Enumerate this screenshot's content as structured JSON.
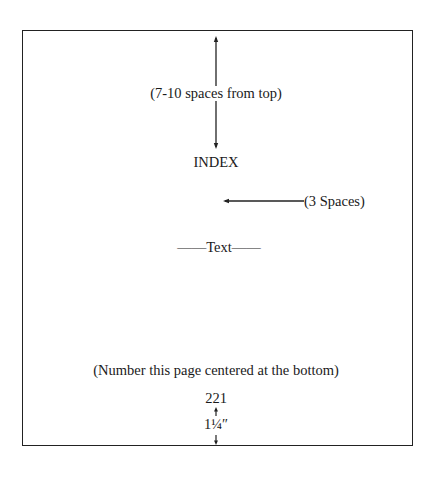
{
  "diagram": {
    "top_spacing_label": "(7-10 spaces from top)",
    "heading": "INDEX",
    "side_spacing_label": "(3 Spaces)",
    "body_placeholder": "——Text——",
    "page_number_note": "(Number this page centered at the bottom)",
    "page_number": "221",
    "bottom_margin_label": "1¼″"
  },
  "colors": {
    "ink": "#1a1a1a",
    "paper": "#ffffff"
  }
}
